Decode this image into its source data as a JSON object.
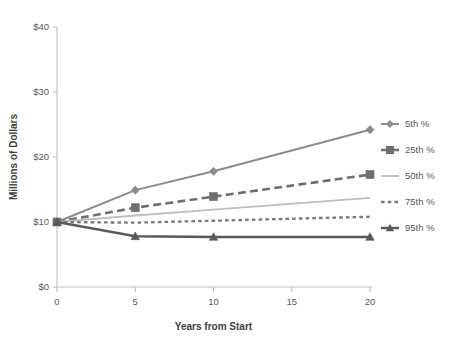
{
  "chart_data": {
    "type": "line",
    "title": "",
    "xlabel": "Years from Start",
    "ylabel": "Millions of Dollars",
    "x": [
      0,
      5,
      10,
      20
    ],
    "xlim": [
      0,
      20
    ],
    "ylim": [
      0,
      40
    ],
    "xticks": [
      "0",
      "5",
      "10",
      "15",
      "20"
    ],
    "xtick_values": [
      0,
      5,
      10,
      15,
      20
    ],
    "yticks": [
      "$0",
      "$10",
      "$20",
      "$30",
      "$40"
    ],
    "ytick_values": [
      0,
      10,
      20,
      30,
      40
    ],
    "grid": false,
    "legend_position": "right",
    "series": [
      {
        "name": "5th %",
        "values": [
          10.0,
          14.9,
          17.8,
          24.2
        ],
        "color": "#8c8c8c",
        "dash": "none",
        "marker": "diamond",
        "width": 2.0
      },
      {
        "name": "25th %",
        "values": [
          10.0,
          12.2,
          13.9,
          17.3
        ],
        "color": "#6e6e6e",
        "dash": "long",
        "marker": "square",
        "width": 2.6
      },
      {
        "name": "50th %",
        "values": [
          10.0,
          11.0,
          11.9,
          13.7
        ],
        "color": "#bfbfbf",
        "dash": "none",
        "marker": "none",
        "width": 1.8
      },
      {
        "name": "75th %",
        "values": [
          10.0,
          9.9,
          10.2,
          10.8
        ],
        "color": "#7a7a7a",
        "dash": "short",
        "marker": "none",
        "width": 2.4
      },
      {
        "name": "95th %",
        "values": [
          10.0,
          7.8,
          7.7,
          7.7
        ],
        "color": "#595959",
        "dash": "none",
        "marker": "triangle",
        "width": 2.4
      }
    ]
  },
  "axis": {
    "y_title": "Millions of Dollars",
    "x_title": "Years from Start",
    "y_labels": [
      "$40",
      "$30",
      "$20",
      "$10",
      "$0"
    ],
    "x_labels": [
      "0",
      "5",
      "10",
      "15",
      "20"
    ]
  },
  "legend": {
    "items": [
      {
        "label": "5th %"
      },
      {
        "label": "25th %"
      },
      {
        "label": "50th %"
      },
      {
        "label": "75th %"
      },
      {
        "label": "95th %"
      }
    ]
  },
  "colors": {
    "axis_line": "#bfbfbf",
    "tick_text": "#595959",
    "title_text": "#404040",
    "background": "#ffffff"
  }
}
